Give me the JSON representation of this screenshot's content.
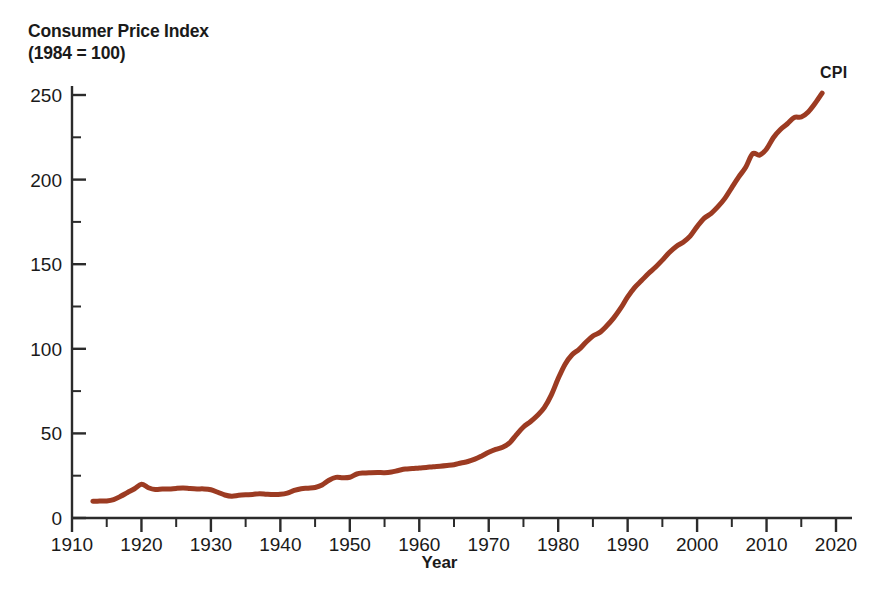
{
  "chart_data": {
    "type": "line",
    "title": "Consumer Price Index",
    "subtitle": "(1984 = 100)",
    "xlabel": "Year",
    "ylabel": "",
    "xlim": [
      1910,
      2020
    ],
    "ylim": [
      0,
      260
    ],
    "grid": false,
    "legend_position": "inline-right-end",
    "line_color": "#9C3B22",
    "line_width": 5,
    "axis_color": "#2b2b2b",
    "background": "#ffffff",
    "xticks_major": [
      1910,
      1920,
      1930,
      1940,
      1950,
      1960,
      1970,
      1980,
      1990,
      2000,
      2010,
      2020
    ],
    "xticks_minor": [
      1915,
      1925,
      1935,
      1945,
      1955,
      1965,
      1975,
      1985,
      1995,
      2005,
      2015
    ],
    "yticks_major": [
      0,
      50,
      100,
      150,
      200,
      250
    ],
    "yticks_minor": [
      25,
      75,
      125,
      175,
      225
    ],
    "xtick_labels": [
      "1910",
      "1920",
      "1930",
      "1940",
      "1950",
      "1960",
      "1970",
      "1980",
      "1990",
      "2000",
      "2010",
      "2020"
    ],
    "ytick_labels": [
      "0",
      "50",
      "100",
      "150",
      "200",
      "250"
    ],
    "series": [
      {
        "name": "CPI",
        "label": "CPI",
        "color": "#9C3B22",
        "x": [
          1913,
          1914,
          1915,
          1916,
          1917,
          1918,
          1919,
          1920,
          1921,
          1922,
          1923,
          1924,
          1925,
          1926,
          1927,
          1928,
          1929,
          1930,
          1931,
          1932,
          1933,
          1934,
          1935,
          1936,
          1937,
          1938,
          1939,
          1940,
          1941,
          1942,
          1943,
          1944,
          1945,
          1946,
          1947,
          1948,
          1949,
          1950,
          1951,
          1952,
          1953,
          1954,
          1955,
          1956,
          1957,
          1958,
          1959,
          1960,
          1961,
          1962,
          1963,
          1964,
          1965,
          1966,
          1967,
          1968,
          1969,
          1970,
          1971,
          1972,
          1973,
          1974,
          1975,
          1976,
          1977,
          1978,
          1979,
          1980,
          1981,
          1982,
          1983,
          1984,
          1985,
          1986,
          1987,
          1988,
          1989,
          1990,
          1991,
          1992,
          1993,
          1994,
          1995,
          1996,
          1997,
          1998,
          1999,
          2000,
          2001,
          2002,
          2003,
          2004,
          2005,
          2006,
          2007,
          2008,
          2009,
          2010,
          2011,
          2012,
          2013,
          2014,
          2015,
          2016,
          2017,
          2018
        ],
        "y": [
          9.9,
          10.0,
          10.1,
          10.9,
          12.8,
          15.1,
          17.3,
          20.0,
          17.9,
          16.8,
          17.1,
          17.1,
          17.5,
          17.7,
          17.4,
          17.2,
          17.2,
          16.7,
          15.2,
          13.6,
          12.9,
          13.4,
          13.7,
          13.9,
          14.4,
          14.1,
          13.9,
          14.0,
          14.7,
          16.3,
          17.3,
          17.6,
          18.0,
          19.5,
          22.3,
          24.0,
          23.8,
          24.1,
          26.0,
          26.6,
          26.8,
          26.9,
          26.8,
          27.2,
          28.1,
          28.9,
          29.2,
          29.6,
          29.9,
          30.3,
          30.6,
          31.0,
          31.5,
          32.5,
          33.4,
          34.8,
          36.7,
          38.8,
          40.5,
          41.8,
          44.4,
          49.3,
          53.8,
          56.9,
          60.6,
          65.2,
          72.6,
          82.4,
          90.9,
          96.5,
          99.6,
          103.9,
          107.6,
          109.7,
          113.6,
          118.3,
          124.0,
          130.7,
          136.2,
          140.3,
          144.5,
          148.2,
          152.4,
          156.9,
          160.5,
          163.0,
          166.6,
          172.2,
          177.1,
          179.9,
          184.0,
          188.9,
          195.3,
          201.6,
          207.3,
          215.3,
          214.5,
          218.1,
          224.9,
          229.6,
          233.0,
          236.7,
          237.0,
          240.0,
          245.1,
          251.1
        ],
        "start_year": 1913,
        "end_year": 2018,
        "start_value": 9.9,
        "end_value": 251.1,
        "notes": "Post-WWI peak 1920 ~20; Great Depression trough 1933 ~12.9; 1970s-80s inflation steep rise; 2009 dip after 2008"
      }
    ]
  }
}
